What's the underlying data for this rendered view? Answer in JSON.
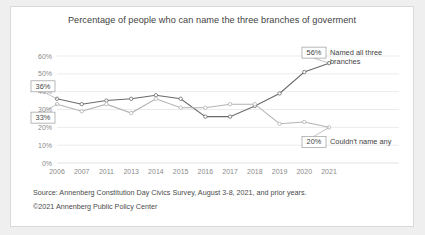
{
  "chart_data": {
    "type": "line",
    "title": "Percentage of people who can name the three branches of goverment",
    "xlabel": "",
    "ylabel": "",
    "ylim": [
      0,
      60
    ],
    "ytick_labels": [
      "0%",
      "10%",
      "20%",
      "30%",
      "40%",
      "50%",
      "60%"
    ],
    "grid": true,
    "legend_position": "right-inline",
    "categories": [
      "2006",
      "2007",
      "2011",
      "2013",
      "2014",
      "2015",
      "2016",
      "2017",
      "2018",
      "2019",
      "2020",
      "2021"
    ],
    "series": [
      {
        "name": "Named all three branches",
        "color": "#6a6a6a",
        "values": [
          36,
          33,
          35,
          36,
          38,
          36,
          26,
          26,
          32,
          39,
          51,
          56
        ]
      },
      {
        "name": "Couldn't name any",
        "color": "#b3b3b3",
        "values": [
          33,
          29,
          33,
          28,
          36,
          31,
          31,
          33,
          33,
          22,
          23,
          20
        ]
      }
    ],
    "annotations": [
      {
        "id": "start-dark",
        "label": "36%",
        "series": "Named all three branches",
        "category": "2006",
        "value": 36
      },
      {
        "id": "start-light",
        "label": "33%",
        "series": "Couldn't name any",
        "category": "2006",
        "value": 33
      },
      {
        "id": "end-dark",
        "label": "56%",
        "series": "Named all three branches",
        "category": "2021",
        "value": 56
      },
      {
        "id": "end-light",
        "label": "20%",
        "series": "Couldn't name any",
        "category": "2021",
        "value": 20
      }
    ],
    "legend_labels": [
      {
        "line1": "Named all three",
        "line2": "branches"
      },
      {
        "line1": "Couldn't name any",
        "line2": ""
      }
    ]
  },
  "footer": {
    "source": "Source: Annenberg Constitution Day Civics Survey, August 3-8, 2021, and prior years.",
    "copyright": "©2021 Annenberg Public Policy Center"
  }
}
